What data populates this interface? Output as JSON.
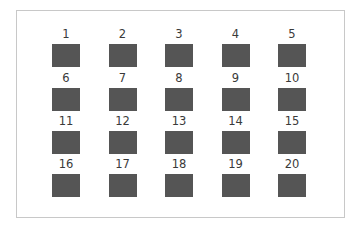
{
  "grid": {
    "rows": 4,
    "columns": 5,
    "square_color": "#555555",
    "border_color": "#c8c8c8",
    "cells": [
      {
        "label": "1"
      },
      {
        "label": "2"
      },
      {
        "label": "3"
      },
      {
        "label": "4"
      },
      {
        "label": "5"
      },
      {
        "label": "6"
      },
      {
        "label": "7"
      },
      {
        "label": "8"
      },
      {
        "label": "9"
      },
      {
        "label": "10"
      },
      {
        "label": "11"
      },
      {
        "label": "12"
      },
      {
        "label": "13"
      },
      {
        "label": "14"
      },
      {
        "label": "15"
      },
      {
        "label": "16"
      },
      {
        "label": "17"
      },
      {
        "label": "18"
      },
      {
        "label": "19"
      },
      {
        "label": "20"
      }
    ]
  }
}
